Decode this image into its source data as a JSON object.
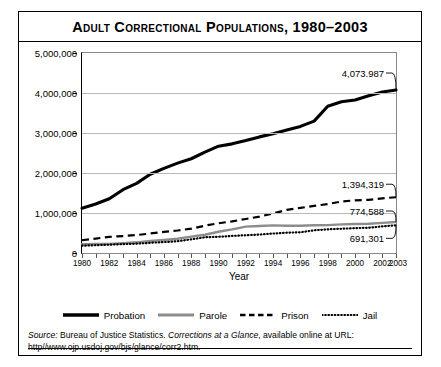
{
  "title": "Adult Correctional Populations, 1980–2003",
  "axes": {
    "xlabel": "Year",
    "ylabel": "",
    "ytick_labels": [
      "5,000,000",
      "4,000,000",
      "3,000,000",
      "2,000,000",
      "1,000,000",
      "0"
    ],
    "xtick_labels": [
      "1980",
      "1982",
      "1984",
      "1986",
      "1988",
      "1990",
      "1992",
      "1994",
      "1996",
      "1998",
      "2000",
      "2002",
      "2003"
    ]
  },
  "legend": [
    {
      "name": "Probation",
      "style": "solid-thick-black",
      "color": "#000000"
    },
    {
      "name": "Parole",
      "style": "solid-gray",
      "color": "#8c8c8c"
    },
    {
      "name": "Prison",
      "style": "dashed-black",
      "color": "#000000"
    },
    {
      "name": "Jail",
      "style": "dotted-black",
      "color": "#000000"
    }
  ],
  "data_labels": [
    {
      "series": "Probation",
      "text": "4,073.987"
    },
    {
      "series": "Prison",
      "text": "1,394,319"
    },
    {
      "series": "Parole",
      "text": "774,588"
    },
    {
      "series": "Jail",
      "text": "691,301"
    }
  ],
  "source": {
    "prefix": "Source:",
    "body_1": " Bureau of Justice Statistics. ",
    "italic_work": "Corrections at a Glance",
    "body_2": ", available online at URL: http//www.ojp.usdoj.gov/bjs/glance/corr2.htm."
  },
  "chart_data": {
    "type": "line",
    "title": "Adult Correctional Populations, 1980–2003",
    "xlabel": "Year",
    "ylabel": "",
    "xlim": [
      1980,
      2003
    ],
    "ylim": [
      0,
      5000000
    ],
    "ytick_interval": 1000000,
    "grid": true,
    "legend_position": "bottom",
    "x": [
      1980,
      1981,
      1982,
      1983,
      1984,
      1985,
      1986,
      1987,
      1988,
      1989,
      1990,
      1991,
      1992,
      1993,
      1994,
      1995,
      1996,
      1997,
      1998,
      1999,
      2000,
      2001,
      2002,
      2003
    ],
    "series": [
      {
        "name": "Probation",
        "color": "#000000",
        "style": "solid-thick",
        "end_label": "4,073.987",
        "values": [
          1118097,
          1225934,
          1357264,
          1582947,
          1740948,
          1968712,
          2114621,
          2247158,
          2356483,
          2522125,
          2670234,
          2728472,
          2811611,
          2903061,
          2981022,
          3077861,
          3164996,
          3296513,
          3670441,
          3779922,
          3826209,
          3931731,
          4024067,
          4073987
        ]
      },
      {
        "name": "Parole",
        "color": "#8c8c8c",
        "style": "solid",
        "end_label": "774,588",
        "values": [
          220438,
          225539,
          224604,
          246440,
          266992,
          300203,
          325638,
          355505,
          407977,
          456803,
          531407,
          590442,
          658601,
          676100,
          690371,
          679421,
          679733,
          694787,
          696385,
          714457,
          723898,
          732333,
          753141,
          774588
        ]
      },
      {
        "name": "Prison",
        "color": "#000000",
        "style": "dashed",
        "end_label": "1,394,319",
        "values": [
          319598,
          360029,
          402914,
          423898,
          448264,
          487593,
          526436,
          562814,
          607766,
          683367,
          743382,
          792535,
          850566,
          909381,
          990147,
          1078542,
          1127528,
          1176564,
          1224469,
          1287172,
          1316333,
          1330007,
          1367856,
          1394319
        ]
      },
      {
        "name": "Jail",
        "color": "#000000",
        "style": "dotted",
        "end_label": "691,301",
        "values": [
          182288,
          195085,
          207853,
          221815,
          233018,
          254986,
          272736,
          294092,
          341893,
          393303,
          405320,
          426479,
          444584,
          459804,
          486474,
          507044,
          518492,
          567079,
          592462,
          605943,
          621149,
          631240,
          665475,
          691301
        ]
      }
    ]
  }
}
